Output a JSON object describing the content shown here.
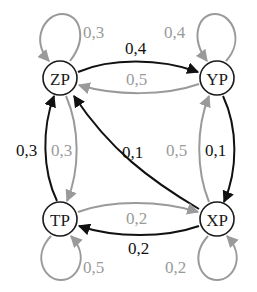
{
  "diagram": {
    "type": "state-transition-graph",
    "colors": {
      "primary": "#111111",
      "secondary": "#9a9a9a"
    },
    "nodes": [
      {
        "id": "ZP",
        "label": "ZP"
      },
      {
        "id": "YP",
        "label": "YP"
      },
      {
        "id": "TP",
        "label": "TP"
      },
      {
        "id": "XP",
        "label": "XP"
      }
    ],
    "edges": {
      "zp_self": {
        "from": "ZP",
        "to": "ZP",
        "label": "0,3",
        "color": "gray"
      },
      "yp_self": {
        "from": "YP",
        "to": "YP",
        "label": "0,4",
        "color": "gray"
      },
      "tp_self": {
        "from": "TP",
        "to": "TP",
        "label": "0,5",
        "color": "gray"
      },
      "xp_self": {
        "from": "XP",
        "to": "XP",
        "label": "0,2",
        "color": "gray"
      },
      "zp_yp": {
        "from": "ZP",
        "to": "YP",
        "label": "0,4",
        "color": "black"
      },
      "yp_zp": {
        "from": "YP",
        "to": "ZP",
        "label": "0,5",
        "color": "gray"
      },
      "tp_zp": {
        "from": "TP",
        "to": "ZP",
        "label": "0,3",
        "color": "black"
      },
      "zp_tp": {
        "from": "ZP",
        "to": "TP",
        "label": "0,3",
        "color": "gray"
      },
      "xp_zp": {
        "from": "XP",
        "to": "ZP",
        "label": "0,1",
        "color": "black"
      },
      "xp_yp": {
        "from": "XP",
        "to": "YP",
        "label": "0,5",
        "color": "gray"
      },
      "yp_xp": {
        "from": "YP",
        "to": "XP",
        "label": "0,1",
        "color": "black"
      },
      "tp_xp": {
        "from": "TP",
        "to": "XP",
        "label": "0,2",
        "color": "gray"
      },
      "xp_tp": {
        "from": "XP",
        "to": "TP",
        "label": "0,2",
        "color": "black"
      }
    }
  }
}
